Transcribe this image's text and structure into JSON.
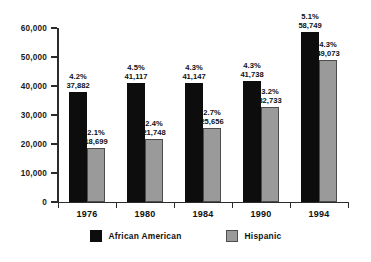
{
  "chart_data": {
    "type": "bar",
    "title": "",
    "subtitle": "",
    "xlabel": "",
    "ylabel": "",
    "categories": [
      "1976",
      "1980",
      "1984",
      "1990",
      "1994"
    ],
    "series": [
      {
        "name": "African American",
        "color": "#0d0d0d",
        "values": [
          37882,
          41117,
          41147,
          41738,
          58749
        ],
        "value_labels": [
          "37,882",
          "41,117",
          "41,147",
          "41,738",
          "58,749"
        ],
        "percent_labels": [
          "4.2%",
          "4.5%",
          "4.3%",
          "4.3%",
          "5.1%"
        ]
      },
      {
        "name": "Hispanic",
        "color": "#9a9a9a",
        "values": [
          18699,
          21748,
          25656,
          32733,
          49073
        ],
        "value_labels": [
          "18,699",
          "21,748",
          "25,656",
          "32,733",
          "49,073"
        ],
        "percent_labels": [
          "2.1%",
          "2.4%",
          "2.7%",
          "3.2%",
          "4.3%"
        ]
      }
    ],
    "ylim": [
      0,
      60000
    ],
    "yticks": [
      0,
      10000,
      20000,
      30000,
      40000,
      50000,
      60000
    ],
    "ytick_labels": [
      "0",
      "10,000",
      "20,000",
      "30,000",
      "40,000",
      "50,000",
      "60,000"
    ],
    "grid": false,
    "legend_position": "bottom"
  },
  "legend": {
    "entries": [
      {
        "label": "African American"
      },
      {
        "label": "Hispanic"
      }
    ]
  }
}
